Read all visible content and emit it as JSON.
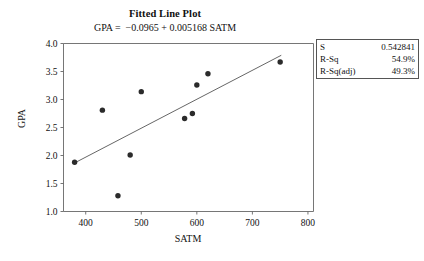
{
  "chart_data": {
    "type": "scatter",
    "title": "Fitted Line Plot",
    "subtitle": "GPA =  −0.0965 + 0.005168 SATM",
    "xlabel": "SATM",
    "ylabel": "GPA",
    "xlim": [
      360,
      810
    ],
    "ylim": [
      1.0,
      4.0
    ],
    "xticks": [
      400,
      500,
      600,
      700,
      800
    ],
    "xtick_labels": [
      "400",
      "500",
      "600",
      "700",
      "800"
    ],
    "yticks": [
      1.0,
      1.5,
      2.0,
      2.5,
      3.0,
      3.5,
      4.0
    ],
    "ytick_labels": [
      "1.0",
      "1.5",
      "2.0",
      "2.5",
      "3.0",
      "3.5",
      "4.0"
    ],
    "grid": false,
    "legend": "none",
    "marker": "filled-circle",
    "marker_color": "#2b2b2b",
    "line_color": "#555555",
    "points": [
      {
        "x": 380,
        "y": 1.88
      },
      {
        "x": 430,
        "y": 2.81
      },
      {
        "x": 458,
        "y": 1.28
      },
      {
        "x": 480,
        "y": 2.01
      },
      {
        "x": 500,
        "y": 3.14
      },
      {
        "x": 578,
        "y": 2.66
      },
      {
        "x": 592,
        "y": 2.75
      },
      {
        "x": 600,
        "y": 3.26
      },
      {
        "x": 620,
        "y": 3.46
      },
      {
        "x": 750,
        "y": 3.67
      }
    ],
    "fit_line": {
      "intercept": -0.0965,
      "slope": 0.005168,
      "x_start": 380,
      "x_end": 752
    }
  },
  "stats_box": {
    "rows": [
      {
        "label": "S",
        "value": "0.542841"
      },
      {
        "label": "R-Sq",
        "value": "54.9%"
      },
      {
        "label": "R-Sq(adj)",
        "value": "49.3%"
      }
    ]
  }
}
